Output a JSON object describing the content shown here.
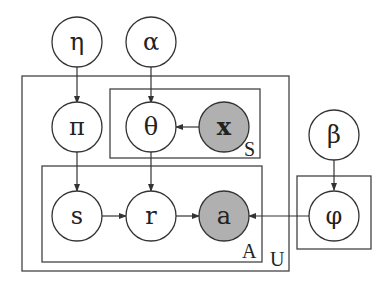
{
  "diagram": {
    "type": "plate-notation-graphical-model",
    "colors": {
      "observed_fill": "#b0b0b0",
      "latent_fill": "#ffffff",
      "stroke": "#333333"
    },
    "nodes": [
      {
        "id": "eta",
        "label": "η",
        "observed": false
      },
      {
        "id": "alpha",
        "label": "α",
        "observed": false
      },
      {
        "id": "pi",
        "label": "π",
        "observed": false
      },
      {
        "id": "theta",
        "label": "θ",
        "observed": false
      },
      {
        "id": "x",
        "label": "x",
        "observed": true
      },
      {
        "id": "beta",
        "label": "β",
        "observed": false
      },
      {
        "id": "s",
        "label": "s",
        "observed": false
      },
      {
        "id": "r",
        "label": "r",
        "observed": false
      },
      {
        "id": "a",
        "label": "a",
        "observed": true
      },
      {
        "id": "phi",
        "label": "φ",
        "observed": false
      }
    ],
    "edges": [
      {
        "from": "eta",
        "to": "pi"
      },
      {
        "from": "alpha",
        "to": "theta"
      },
      {
        "from": "x",
        "to": "theta"
      },
      {
        "from": "pi",
        "to": "s"
      },
      {
        "from": "theta",
        "to": "r"
      },
      {
        "from": "s",
        "to": "r"
      },
      {
        "from": "r",
        "to": "a"
      },
      {
        "from": "phi",
        "to": "a"
      },
      {
        "from": "beta",
        "to": "phi"
      }
    ],
    "plates": [
      {
        "id": "U",
        "label": "U",
        "contains": [
          "pi",
          "theta",
          "x",
          "s",
          "r",
          "a"
        ]
      },
      {
        "id": "S",
        "label": "S",
        "contains": [
          "theta",
          "x"
        ]
      },
      {
        "id": "A",
        "label": "A",
        "contains": [
          "s",
          "r",
          "a"
        ]
      },
      {
        "id": "phi-plate",
        "label": "",
        "contains": [
          "phi"
        ]
      }
    ]
  }
}
